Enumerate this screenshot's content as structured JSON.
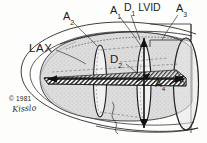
{
  "figure": {
    "background_color": "#fdfdfc",
    "ink_color": "#1c1c1c",
    "interior_fill_color": "#d9d9d9",
    "hatch_color": "#3a3a3a"
  },
  "labels": {
    "a2": "A",
    "a2_sub": "2",
    "a1": "A",
    "a1_sub": "1",
    "d1": "D",
    "d1_sub": "1",
    "lvid": "LVID",
    "a3": "A",
    "a3_sub": "3",
    "lax": "LAX",
    "d2": "D",
    "d2_sub": "2",
    "a4": "A",
    "a4_sub": "4"
  },
  "credit": {
    "copyright": "© 1981",
    "signature": "Kisslo"
  },
  "annotations": [
    {
      "name": "A2",
      "text": "A₂",
      "role": "cross-sectional-area-plane",
      "x": 63,
      "y": 11
    },
    {
      "name": "A1",
      "text": "A₁",
      "role": "cross-sectional-area-plane",
      "x": 110,
      "y": 5
    },
    {
      "name": "D1 LVID",
      "text": "D₁ LVID",
      "role": "minor-axis-diameter",
      "x": 124,
      "y": 2
    },
    {
      "name": "A3",
      "text": "A₃",
      "role": "cross-sectional-area-plane",
      "x": 176,
      "y": 3
    },
    {
      "name": "LAX",
      "text": "LAX",
      "role": "long-axis",
      "x": 29,
      "y": 43
    },
    {
      "name": "D2",
      "text": "D₂",
      "role": "secondary-diameter",
      "x": 110,
      "y": 54
    },
    {
      "name": "A4",
      "text": "A₄",
      "role": "long-axis-plane-area",
      "x": 155,
      "y": 79
    }
  ]
}
